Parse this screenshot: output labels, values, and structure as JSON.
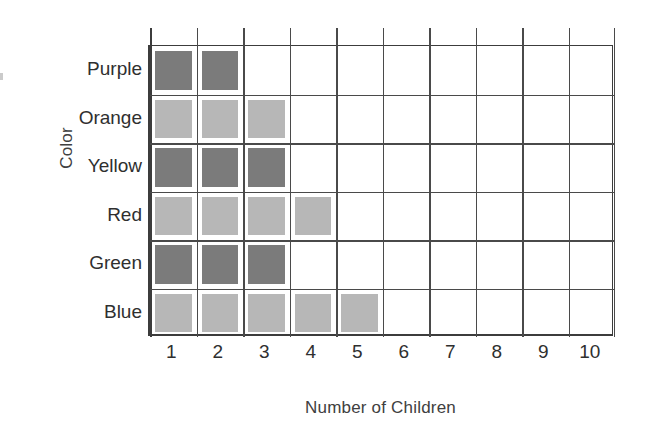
{
  "chart_data": {
    "type": "bar",
    "orientation": "horizontal",
    "style": "square-unit-pictograph-grid",
    "title": "",
    "subtitle": "",
    "xlabel": "Number of Children",
    "ylabel": "Color",
    "categories": [
      "Purple",
      "Orange",
      "Yellow",
      "Red",
      "Green",
      "Blue"
    ],
    "values": [
      2,
      3,
      3,
      4,
      3,
      5
    ],
    "series": [
      {
        "name": "Number of Children",
        "values": [
          2,
          3,
          3,
          4,
          3,
          5
        ]
      }
    ],
    "x": [
      1,
      2,
      3,
      4,
      5,
      6,
      7,
      8,
      9,
      10
    ],
    "xtick_labels": [
      "1",
      "2",
      "3",
      "4",
      "5",
      "6",
      "7",
      "8",
      "9",
      "10"
    ],
    "ytick_labels": [
      "Purple",
      "Orange",
      "Yellow",
      "Red",
      "Green",
      "Blue"
    ],
    "xlim": [
      0,
      10
    ],
    "grid": true,
    "legend": false,
    "legend_position": "none",
    "rows": [
      {
        "label": "Purple",
        "value": 2,
        "fill": "#7b7b7b",
        "shade": "dark"
      },
      {
        "label": "Orange",
        "value": 3,
        "fill": "#b7b7b7",
        "shade": "light"
      },
      {
        "label": "Yellow",
        "value": 3,
        "fill": "#7b7b7b",
        "shade": "dark"
      },
      {
        "label": "Red",
        "value": 4,
        "fill": "#b7b7b7",
        "shade": "light"
      },
      {
        "label": "Green",
        "value": 3,
        "fill": "#7b7b7b",
        "shade": "dark"
      },
      {
        "label": "Blue",
        "value": 5,
        "fill": "#b7b7b7",
        "shade": "light"
      }
    ],
    "colors": {
      "dark_square": "#7b7b7b",
      "light_square": "#b7b7b7",
      "gridline": "#4a4a4a",
      "axis": "#3c3c3c",
      "text": "#2f2f2f",
      "background": "#ffffff"
    }
  }
}
